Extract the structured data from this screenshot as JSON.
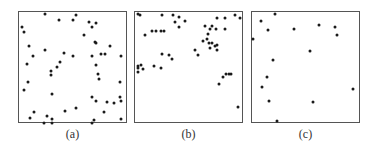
{
  "panels": [
    {
      "label": "(a)",
      "left": 18,
      "points": [
        [
          24,
          1
        ],
        [
          53,
          2
        ],
        [
          37,
          7
        ],
        [
          50,
          7
        ],
        [
          66,
          9
        ],
        [
          72,
          10
        ],
        [
          2,
          13
        ],
        [
          68,
          13
        ],
        [
          4,
          18
        ],
        [
          61,
          21
        ],
        [
          71,
          27
        ],
        [
          72,
          28
        ],
        [
          9,
          31
        ],
        [
          85,
          31
        ],
        [
          24,
          34
        ],
        [
          42,
          37
        ],
        [
          77,
          38
        ],
        [
          81,
          38
        ],
        [
          13,
          40
        ],
        [
          50,
          40
        ],
        [
          68,
          40
        ],
        [
          96,
          40
        ],
        [
          38,
          45
        ],
        [
          7,
          47
        ],
        [
          72,
          48
        ],
        [
          35,
          50
        ],
        [
          30,
          54
        ],
        [
          74,
          56
        ],
        [
          30,
          57
        ],
        [
          75,
          61
        ],
        [
          8,
          64
        ],
        [
          95,
          64
        ],
        [
          4,
          71
        ],
        [
          31,
          75
        ],
        [
          68,
          78
        ],
        [
          95,
          78
        ],
        [
          72,
          81
        ],
        [
          83,
          82
        ],
        [
          89,
          83
        ],
        [
          96,
          81
        ],
        [
          53,
          88
        ],
        [
          14,
          91
        ],
        [
          43,
          90
        ],
        [
          80,
          91
        ],
        [
          26,
          95
        ],
        [
          10,
          97
        ],
        [
          31,
          98
        ],
        [
          31,
          101
        ],
        [
          23,
          101
        ],
        [
          68,
          101
        ],
        [
          70,
          99
        ],
        [
          96,
          98
        ]
      ]
    },
    {
      "label": "(b)",
      "left": 134,
      "points": [
        [
          2,
          1
        ],
        [
          4,
          2
        ],
        [
          25,
          2
        ],
        [
          35,
          2
        ],
        [
          41,
          4
        ],
        [
          94,
          2
        ],
        [
          99,
          5
        ],
        [
          77,
          5
        ],
        [
          84,
          5
        ],
        [
          37,
          9
        ],
        [
          47,
          8
        ],
        [
          66,
          12
        ],
        [
          72,
          12
        ],
        [
          41,
          13
        ],
        [
          70,
          15
        ],
        [
          76,
          15
        ],
        [
          84,
          15
        ],
        [
          16,
          17
        ],
        [
          19,
          17
        ],
        [
          24,
          17
        ],
        [
          27,
          17
        ],
        [
          9,
          21
        ],
        [
          68,
          20
        ],
        [
          67,
          24
        ],
        [
          64,
          26
        ],
        [
          69,
          28
        ],
        [
          72,
          28
        ],
        [
          75,
          31
        ],
        [
          77,
          30
        ],
        [
          77,
          34
        ],
        [
          70,
          33
        ],
        [
          56,
          34
        ],
        [
          25,
          38
        ],
        [
          32,
          39
        ],
        [
          59,
          39
        ],
        [
          34,
          43
        ],
        [
          17,
          49
        ],
        [
          2,
          49
        ],
        [
          5,
          48
        ],
        [
          2,
          51
        ],
        [
          7,
          52
        ],
        [
          24,
          51
        ],
        [
          2,
          55
        ],
        [
          85,
          56
        ],
        [
          88,
          56
        ],
        [
          90,
          56
        ],
        [
          83,
          59
        ],
        [
          79,
          66
        ],
        [
          97,
          87
        ]
      ]
    },
    {
      "label": "(c)",
      "left": 251,
      "points": [
        [
          21,
          1
        ],
        [
          8,
          8
        ],
        [
          15,
          16
        ],
        [
          39,
          15
        ],
        [
          63,
          11
        ],
        [
          78,
          13
        ],
        [
          80,
          21
        ],
        [
          0,
          24
        ],
        [
          54,
          35
        ],
        [
          19,
          44
        ],
        [
          14,
          59
        ],
        [
          9,
          68
        ],
        [
          95,
          70
        ],
        [
          16,
          81
        ],
        [
          57,
          82
        ],
        [
          23,
          100
        ]
      ]
    }
  ]
}
